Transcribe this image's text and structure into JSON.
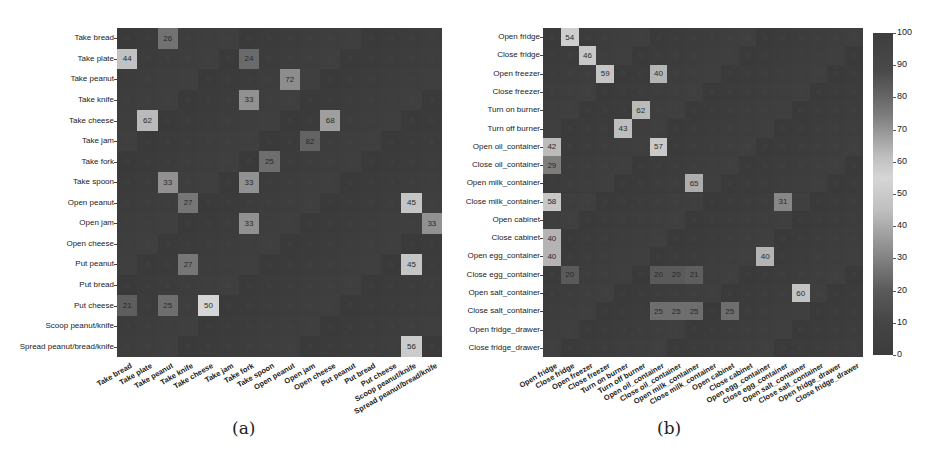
{
  "chart_data": [
    {
      "type": "heatmap",
      "title": "",
      "caption": "(a)",
      "xlabel": "",
      "ylabel": "",
      "rows": [
        "Take bread",
        "Take plate",
        "Take peanut",
        "Take knife",
        "Take cheese",
        "Take jam",
        "Take fork",
        "Take spoon",
        "Open peanut",
        "Open jam",
        "Open cheese",
        "Put peanut",
        "Put bread",
        "Put cheese",
        "Scoop peanut/knife",
        "Spread peanut/bread/knife"
      ],
      "columns": [
        "Take bread",
        "Take plate",
        "Take peanut",
        "Take knife",
        "Take cheese",
        "Take jam",
        "Take fork",
        "Take spoon",
        "Open peanut",
        "Open jam",
        "Open cheese",
        "Put peanut",
        "Put bread",
        "Put cheese",
        "Scoop peanut/knife",
        "Spread peanut/bread/knife"
      ],
      "highlighted_cells": [
        {
          "row": 0,
          "col": 2,
          "value": 26
        },
        {
          "row": 1,
          "col": 0,
          "value": 44
        },
        {
          "row": 1,
          "col": 6,
          "value": 24
        },
        {
          "row": 2,
          "col": 8,
          "value": 72
        },
        {
          "row": 3,
          "col": 6,
          "value": 33
        },
        {
          "row": 4,
          "col": 1,
          "value": 62
        },
        {
          "row": 4,
          "col": 10,
          "value": 68
        },
        {
          "row": 5,
          "col": 9,
          "value": 82
        },
        {
          "row": 6,
          "col": 7,
          "value": 25
        },
        {
          "row": 7,
          "col": 2,
          "value": 33
        },
        {
          "row": 7,
          "col": 6,
          "value": 33
        },
        {
          "row": 8,
          "col": 3,
          "value": 27
        },
        {
          "row": 8,
          "col": 14,
          "value": 45
        },
        {
          "row": 9,
          "col": 6,
          "value": 33
        },
        {
          "row": 9,
          "col": 15,
          "value": 33
        },
        {
          "row": 11,
          "col": 3,
          "value": 27
        },
        {
          "row": 11,
          "col": 14,
          "value": 45
        },
        {
          "row": 13,
          "col": 0,
          "value": 21
        },
        {
          "row": 13,
          "col": 2,
          "value": 25
        },
        {
          "row": 13,
          "col": 4,
          "value": 50
        },
        {
          "row": 15,
          "col": 14,
          "value": 56
        }
      ],
      "default_value": 0
    },
    {
      "type": "heatmap",
      "title": "",
      "caption": "(b)",
      "xlabel": "",
      "ylabel": "",
      "rows": [
        "Open fridge",
        "Close fridge",
        "Open freezer",
        "Close freezer",
        "Turn on burner",
        "Turn off burner",
        "Open oil_container",
        "Close oil_container",
        "Open milk_container",
        "Close milk_container",
        "Open cabinet",
        "Close cabinet",
        "Open egg_container",
        "Close egg_container",
        "Open salt_container",
        "Close salt_container",
        "Open fridge_drawer",
        "Close fridge_drawer"
      ],
      "columns": [
        "Open fridge",
        "Close fridge",
        "Open freezer",
        "Close freezer",
        "Turn on burner",
        "Turn off burner",
        "Open oil_container",
        "Close oil_container",
        "Open milk_container",
        "Close milk_container",
        "Open cabinet",
        "Close cabinet",
        "Open egg_container",
        "Close egg_container",
        "Open salt_container",
        "Close salt_container",
        "Open fridge_drawer",
        "Close fridge_drawer"
      ],
      "highlighted_cells": [
        {
          "row": 0,
          "col": 1,
          "value": 54
        },
        {
          "row": 1,
          "col": 2,
          "value": 46
        },
        {
          "row": 2,
          "col": 3,
          "value": 59
        },
        {
          "row": 2,
          "col": 6,
          "value": 40
        },
        {
          "row": 4,
          "col": 5,
          "value": 62
        },
        {
          "row": 5,
          "col": 4,
          "value": 43
        },
        {
          "row": 6,
          "col": 0,
          "value": 42
        },
        {
          "row": 6,
          "col": 6,
          "value": 57
        },
        {
          "row": 7,
          "col": 0,
          "value": 29
        },
        {
          "row": 8,
          "col": 8,
          "value": 65
        },
        {
          "row": 9,
          "col": 0,
          "value": 58
        },
        {
          "row": 9,
          "col": 13,
          "value": 31
        },
        {
          "row": 11,
          "col": 0,
          "value": 40
        },
        {
          "row": 12,
          "col": 0,
          "value": 40
        },
        {
          "row": 12,
          "col": 12,
          "value": 40
        },
        {
          "row": 13,
          "col": 1,
          "value": 20
        },
        {
          "row": 13,
          "col": 6,
          "value": 20
        },
        {
          "row": 13,
          "col": 7,
          "value": 20
        },
        {
          "row": 13,
          "col": 8,
          "value": 21
        },
        {
          "row": 14,
          "col": 14,
          "value": 60
        },
        {
          "row": 15,
          "col": 6,
          "value": 25
        },
        {
          "row": 15,
          "col": 7,
          "value": 25
        },
        {
          "row": 15,
          "col": 8,
          "value": 25
        },
        {
          "row": 15,
          "col": 10,
          "value": 25
        }
      ],
      "default_value": 0
    }
  ],
  "colorbar": {
    "min": 0,
    "max": 100,
    "ticks": [
      0,
      10,
      20,
      30,
      40,
      50,
      60,
      70,
      80,
      90,
      100
    ]
  },
  "captions": {
    "a": "(a)",
    "b": "(b)"
  }
}
